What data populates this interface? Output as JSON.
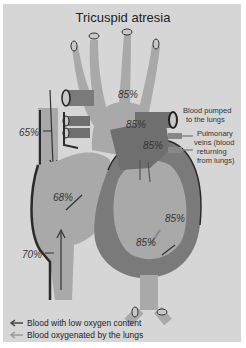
{
  "title": "Tricuspid atresia",
  "percentages": {
    "aorta": "85%",
    "pulmonary_artery": "85%",
    "left_atrium": "85%",
    "svc": "65%",
    "right_atrium": "68%",
    "left_ventricle_upper": "85%",
    "left_ventricle_lower": "85%",
    "ivc": "70%"
  },
  "labels": {
    "pulmonary_artery_line1": "Blood pumped",
    "pulmonary_artery_line2": "to the lungs",
    "pulmonary_veins_line1": "Pulmonary",
    "pulmonary_veins_line2": "veins (blood",
    "pulmonary_veins_line3": "returning",
    "pulmonary_veins_line4": "from lungs)"
  },
  "legend": [
    {
      "label": "Blood with low oxygen content",
      "color": "#444444"
    },
    {
      "label": "Blood oxygenated by the lungs",
      "color": "#9a9a9a"
    }
  ],
  "colors": {
    "background": "#d6d6d6",
    "vessel_light": "#a9a9a9",
    "vessel_dark": "#6f6f6f",
    "outline": "#2a2a2a"
  }
}
